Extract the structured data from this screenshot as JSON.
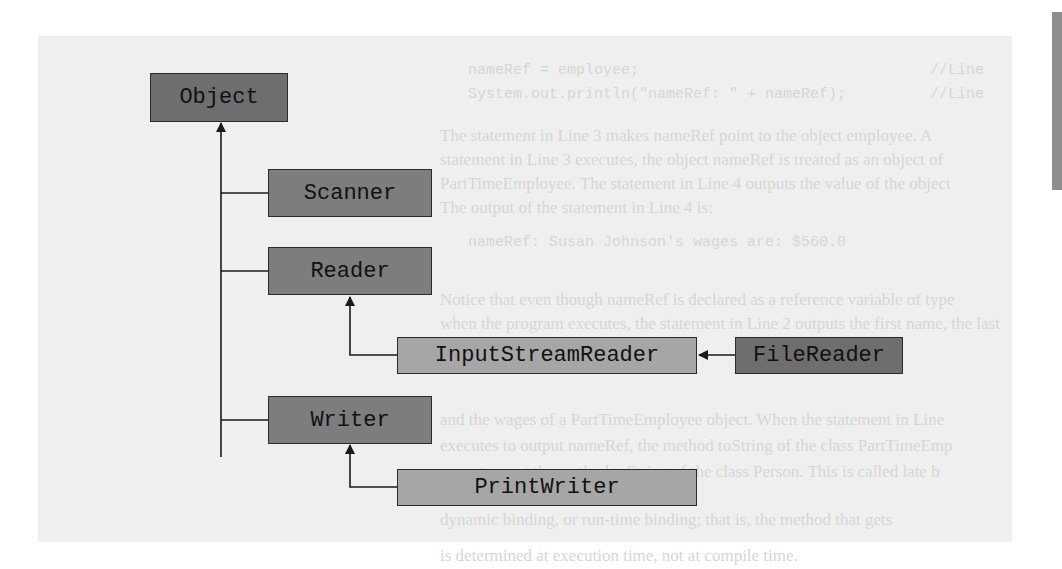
{
  "diagram": {
    "title": "",
    "background_text": {
      "code_lines": [
        "nameRef = employee;",
        "System.out.println(\"nameRef: \" + nameRef);"
      ],
      "comments": [
        "//Line",
        "//Line"
      ],
      "paragraph_lines": [
        "The statement in Line 3 makes nameRef point to the object employee. A",
        "statement in Line 3 executes, the object nameRef is treated as an object of",
        "PartTimeEmployee. The statement in Line 4 outputs the value of the object",
        "The output of the statement in Line 4 is:",
        "nameRef: Susan Johnson's wages are: $560.0",
        "Notice that even though nameRef is declared as a reference variable of type",
        "when the program executes, the statement in Line 2 outputs the first name, the last",
        "and the wages of a PartTimeEmployee object. When the statement in Line",
        "executes to output nameRef, the method toString of the class PartTimeEmp",
        "executes, not the method toString of the class Person. This is called late b",
        "dynamic binding, or run-time binding; that is, the method that gets",
        "is determined at execution time, not at compile time."
      ]
    },
    "nodes": [
      {
        "id": "object",
        "label": "Object",
        "shade": "dark"
      },
      {
        "id": "scanner",
        "label": "Scanner",
        "shade": "mid"
      },
      {
        "id": "reader",
        "label": "Reader",
        "shade": "mid"
      },
      {
        "id": "input-stream-reader",
        "label": "InputStreamReader",
        "shade": "light"
      },
      {
        "id": "file-reader",
        "label": "FileReader",
        "shade": "dark"
      },
      {
        "id": "writer",
        "label": "Writer",
        "shade": "mid"
      },
      {
        "id": "print-writer",
        "label": "PrintWriter",
        "shade": "light"
      }
    ],
    "edges": [
      {
        "from": "Scanner",
        "to": "Object",
        "type": "inheritance"
      },
      {
        "from": "Reader",
        "to": "Object",
        "type": "inheritance"
      },
      {
        "from": "Writer",
        "to": "Object",
        "type": "inheritance"
      },
      {
        "from": "InputStreamReader",
        "to": "Reader",
        "type": "inheritance"
      },
      {
        "from": "FileReader",
        "to": "InputStreamReader",
        "type": "inheritance"
      },
      {
        "from": "PrintWriter",
        "to": "Writer",
        "type": "inheritance"
      }
    ],
    "colors": {
      "panel": "#efefef",
      "dark_box": "#6e6e6e",
      "mid_box": "#7d7d7d",
      "light_box": "#a6a6a6",
      "line": "#1a1a1a"
    }
  }
}
